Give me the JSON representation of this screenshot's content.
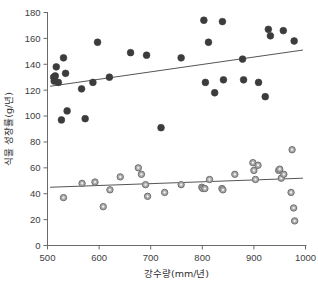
{
  "chart_data": {
    "type": "scatter",
    "title": "",
    "xlabel": "강수량(mm/년)",
    "ylabel": "식물 성장률(g/년)",
    "xlim": [
      500,
      1000
    ],
    "ylim": [
      0,
      180
    ],
    "xticks": [
      500,
      600,
      700,
      800,
      900,
      1000
    ],
    "yticks": [
      0,
      20,
      40,
      60,
      80,
      100,
      120,
      140,
      160,
      180
    ],
    "xtick_labels": [
      "500",
      "600",
      "700",
      "800",
      "900",
      "1000"
    ],
    "ytick_labels": [
      "0",
      "20",
      "40",
      "60",
      "80",
      "100",
      "120",
      "140",
      "160",
      "180"
    ],
    "grid": false,
    "legend": "none",
    "series": [
      {
        "name": "dark-series",
        "marker": "filled-circle",
        "color": "#3c3c3c",
        "edge_color": "#2a2a2a",
        "points": [
          [
            512,
            130
          ],
          [
            513,
            127
          ],
          [
            515,
            131
          ],
          [
            517,
            138
          ],
          [
            521,
            126
          ],
          [
            527,
            97
          ],
          [
            531,
            145
          ],
          [
            535,
            133
          ],
          [
            538,
            104
          ],
          [
            566,
            121
          ],
          [
            573,
            98
          ],
          [
            588,
            126
          ],
          [
            597,
            157
          ],
          [
            620,
            130
          ],
          [
            661,
            149
          ],
          [
            692,
            147
          ],
          [
            720,
            91
          ],
          [
            759,
            145
          ],
          [
            803,
            174
          ],
          [
            806,
            126
          ],
          [
            812,
            157
          ],
          [
            824,
            118
          ],
          [
            839,
            173
          ],
          [
            841,
            128
          ],
          [
            878,
            144
          ],
          [
            880,
            128
          ],
          [
            909,
            126
          ],
          [
            922,
            115
          ],
          [
            928,
            167
          ],
          [
            932,
            162
          ],
          [
            957,
            166
          ],
          [
            978,
            158
          ]
        ],
        "fit_line": {
          "x1": 505,
          "y1": 123,
          "x2": 995,
          "y2": 151
        }
      },
      {
        "name": "light-series",
        "marker": "open-circle",
        "color": "#ababab",
        "edge_color": "#6f6f6f",
        "points": [
          [
            531,
            37
          ],
          [
            567,
            48
          ],
          [
            592,
            49
          ],
          [
            608,
            30
          ],
          [
            621,
            43
          ],
          [
            641,
            53
          ],
          [
            676,
            60
          ],
          [
            682,
            55
          ],
          [
            690,
            47
          ],
          [
            694,
            38
          ],
          [
            727,
            41
          ],
          [
            759,
            47
          ],
          [
            799,
            45
          ],
          [
            801,
            44
          ],
          [
            805,
            44
          ],
          [
            814,
            51
          ],
          [
            838,
            44
          ],
          [
            840,
            43
          ],
          [
            863,
            55
          ],
          [
            898,
            64
          ],
          [
            900,
            58
          ],
          [
            908,
            62
          ],
          [
            903,
            51
          ],
          [
            948,
            58
          ],
          [
            950,
            59
          ],
          [
            953,
            52
          ],
          [
            958,
            55
          ],
          [
            972,
            41
          ],
          [
            974,
            74
          ],
          [
            977,
            29
          ],
          [
            979,
            19
          ]
        ],
        "fit_line": {
          "x1": 505,
          "y1": 45,
          "x2": 995,
          "y2": 52
        }
      }
    ]
  }
}
